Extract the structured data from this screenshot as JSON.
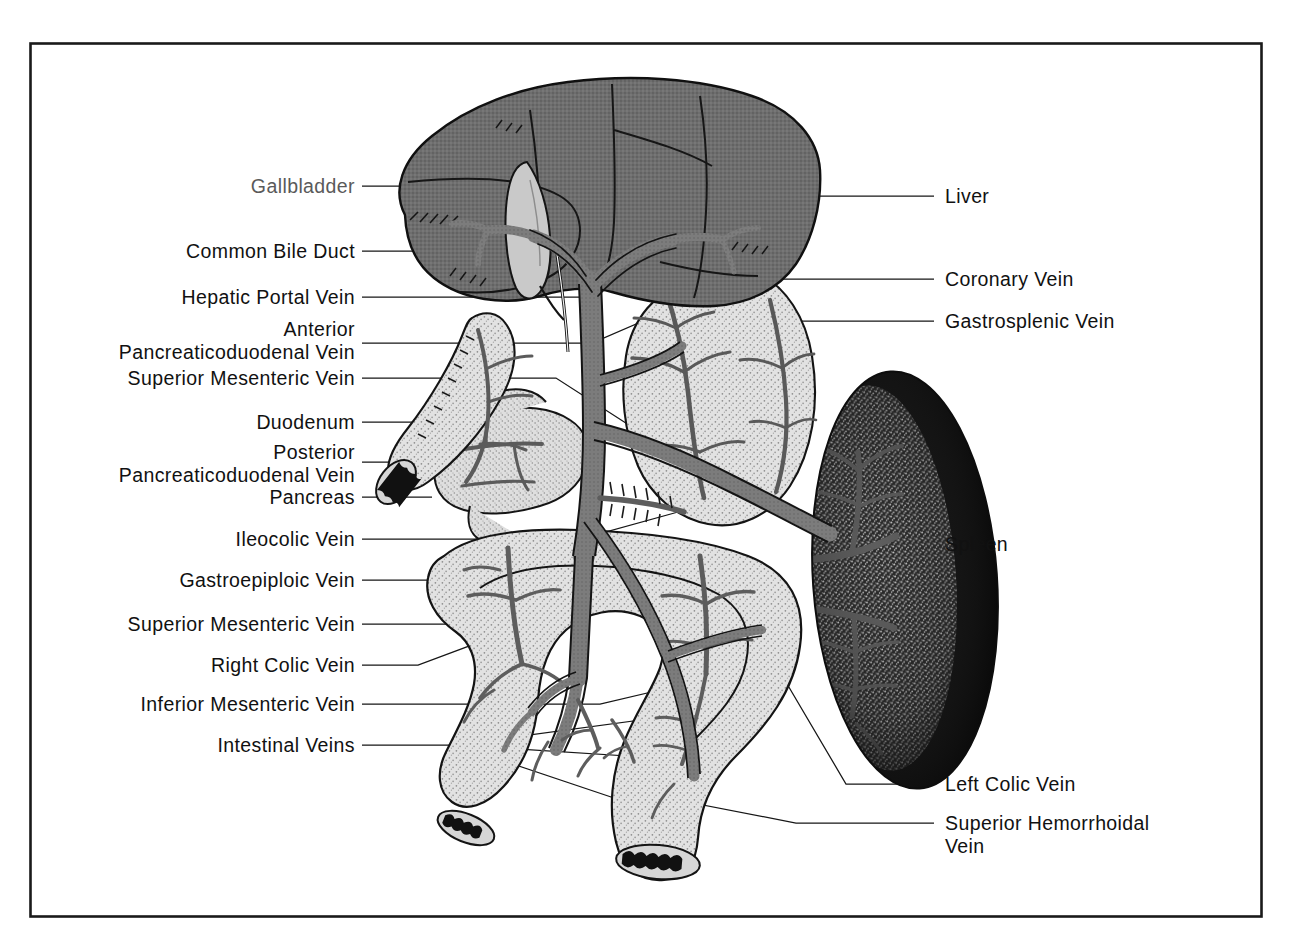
{
  "figure": {
    "frame": {
      "color": "#1a1a1a",
      "x": 30,
      "y": 43,
      "width": 1232,
      "height": 874
    }
  },
  "palette": {
    "background": "#ffffff",
    "frame_border": "#1a1a1a",
    "liver_fill": "#6e6e6e",
    "liver_outline": "#141414",
    "vein_fill": "#7c7c7c",
    "vein_outline": "#141414",
    "organ_light_fill": "#d8d8d8",
    "organ_light_outline": "#141414",
    "spleen_dark": "#171717",
    "spleen_speckle": "#9a9a9a",
    "gallbladder_fill": "#c9c9c9",
    "leader_line": "#141414",
    "label_text": "#111111",
    "label_muted": "#5a5a5a"
  },
  "labels_left": [
    {
      "id": "gallbladder",
      "text": "Gallbladder",
      "muted": true,
      "lines": 1,
      "text_right": 355,
      "baseline_y": 186,
      "leader_start_x": 362,
      "leader_points": "362,186 676,186"
    },
    {
      "id": "common-bile-duct",
      "text": "Common Bile Duct",
      "muted": false,
      "lines": 1,
      "text_right": 355,
      "baseline_y": 251,
      "leader_start_x": 362,
      "leader_points": "362,251 692,251"
    },
    {
      "id": "hepatic-portal-vein",
      "text": "Hepatic Portal Vein",
      "muted": false,
      "lines": 1,
      "text_right": 355,
      "baseline_y": 297,
      "leader_start_x": 362,
      "leader_points": "362,297 598,297"
    },
    {
      "id": "anterior-pancreaticoduodenal-vein",
      "text": "Anterior\nPancreaticoduodenal Vein",
      "muted": false,
      "lines": 2,
      "text_right": 355,
      "baseline_y": 340,
      "leader_start_x": 362,
      "leader_points": "362,343 592,343 690,300"
    },
    {
      "id": "superior-mesenteric-vein-upper",
      "text": "Superior Mesenteric Vein",
      "muted": false,
      "lines": 1,
      "text_right": 355,
      "baseline_y": 378,
      "leader_start_x": 362,
      "leader_points": "362,378 560,378 640,432"
    },
    {
      "id": "duodenum",
      "text": "Duodenum",
      "muted": false,
      "lines": 1,
      "text_right": 355,
      "baseline_y": 422,
      "leader_start_x": 362,
      "leader_points": "362,422 470,422"
    },
    {
      "id": "posterior-pancreaticoduodenal-vein",
      "text": "Posterior\nPancreaticoduodenal Vein",
      "muted": false,
      "lines": 2,
      "text_right": 355,
      "baseline_y": 452,
      "leader_start_x": 362,
      "leader_points": "362,462 540,462 616,430"
    },
    {
      "id": "pancreas",
      "text": "Pancreas",
      "muted": false,
      "lines": 1,
      "text_right": 355,
      "baseline_y": 497,
      "leader_start_x": 362,
      "leader_points": "362,497 430,497"
    },
    {
      "id": "ileocolic-vein",
      "text": "Ileocolic Vein",
      "muted": false,
      "lines": 1,
      "text_right": 355,
      "baseline_y": 539,
      "leader_start_x": 362,
      "leader_points": "362,539 520,539 566,566"
    },
    {
      "id": "gastroepiploic-vein",
      "text": "Gastroepiploic Vein",
      "muted": false,
      "lines": 1,
      "text_right": 355,
      "baseline_y": 580,
      "leader_start_x": 362,
      "leader_points": "362,580 435,580 676,512"
    },
    {
      "id": "superior-mesenteric-vein-lower",
      "text": "Superior Mesenteric Vein",
      "muted": false,
      "lines": 1,
      "text_right": 355,
      "baseline_y": 624,
      "leader_start_x": 362,
      "leader_points": "362,624 572,624"
    },
    {
      "id": "right-colic-vein",
      "text": "Right Colic Vein",
      "muted": false,
      "lines": 1,
      "text_right": 355,
      "baseline_y": 665,
      "leader_start_x": 362,
      "leader_points": "362,665 420,665 510,630"
    },
    {
      "id": "inferior-mesenteric-vein",
      "text": "Inferior Mesenteric Vein",
      "muted": false,
      "lines": 1,
      "text_right": 355,
      "baseline_y": 704,
      "leader_start_x": 362,
      "leader_points": "362,704 600,704 656,690"
    },
    {
      "id": "intestinal-veins",
      "text": "Intestinal Veins",
      "muted": false,
      "lines": 1,
      "text_right": 355,
      "baseline_y": 745,
      "leader_start_x": 362,
      "leader_points": "362,745 456,745"
    }
  ],
  "labels_right": [
    {
      "id": "liver",
      "text": "Liver",
      "lines": 1,
      "text_left": 945,
      "baseline_y": 196,
      "leader_points": "780,196 932,196"
    },
    {
      "id": "coronary-vein",
      "text": "Coronary Vein",
      "lines": 1,
      "text_left": 945,
      "baseline_y": 279,
      "leader_points": "663,310 700,279 932,279"
    },
    {
      "id": "gastrosplenic-vein",
      "text": "Gastrosplenic Vein",
      "lines": 1,
      "text_left": 945,
      "baseline_y": 321,
      "leader_points": "680,348 720,321 932,321"
    },
    {
      "id": "spleen",
      "text": "Spleen",
      "lines": 1,
      "text_left": 945,
      "baseline_y": 544,
      "leader_points": "884,544 932,544"
    },
    {
      "id": "left-colic-vein",
      "text": "Left Colic Vein",
      "lines": 1,
      "text_left": 945,
      "baseline_y": 784,
      "leader_points": "760,660 840,784 932,784"
    },
    {
      "id": "superior-hemorrhoidal-vein",
      "text": "Superior Hemorrhoidal\nVein",
      "lines": 2,
      "text_left": 945,
      "baseline_y": 823,
      "leader_points": "634,790 790,823 932,823"
    }
  ],
  "anatomy": {
    "organs": [
      {
        "name": "liver",
        "shade": "dark-gray",
        "label_ref": "liver"
      },
      {
        "name": "gallbladder",
        "shade": "light-gray",
        "label_ref": "gallbladder"
      },
      {
        "name": "stomach",
        "shade": "light-stipple",
        "label_ref": "gastrosplenic-vein"
      },
      {
        "name": "spleen",
        "shade": "dark-stipple",
        "label_ref": "spleen"
      },
      {
        "name": "pancreas",
        "shade": "light-stipple",
        "label_ref": "pancreas"
      },
      {
        "name": "duodenum",
        "shade": "light-stipple",
        "label_ref": "duodenum"
      },
      {
        "name": "colon",
        "shade": "light-stipple",
        "label_ref": "intestinal-veins"
      }
    ],
    "vessels": [
      "hepatic-portal-vein",
      "superior-mesenteric-vein",
      "inferior-mesenteric-vein",
      "gastrosplenic-vein",
      "coronary-vein",
      "gastroepiploic-vein",
      "ileocolic-vein",
      "right-colic-vein",
      "left-colic-vein",
      "superior-hemorrhoidal-vein",
      "intestinal-veins",
      "anterior-pancreaticoduodenal-vein",
      "posterior-pancreaticoduodenal-vein",
      "common-bile-duct"
    ]
  }
}
